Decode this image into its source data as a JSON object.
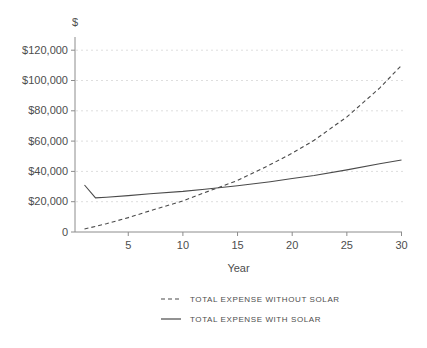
{
  "chart_data": {
    "type": "line",
    "title": "",
    "y_axis_title": "$",
    "x_axis_title": "Year",
    "x_range": [
      0,
      30
    ],
    "y_range": [
      0,
      130000
    ],
    "x_ticks": [
      5,
      10,
      15,
      20,
      25,
      30
    ],
    "y_ticks": [
      {
        "value": 0,
        "label": "0"
      },
      {
        "value": 20000,
        "label": "$20,000"
      },
      {
        "value": 40000,
        "label": "$40,000"
      },
      {
        "value": 60000,
        "label": "$60,000"
      },
      {
        "value": 80000,
        "label": "$80,000"
      },
      {
        "value": 100000,
        "label": "$100,000"
      },
      {
        "value": 120000,
        "label": "$120,000"
      }
    ],
    "grid": "horizontal-dotted",
    "legend_position": "bottom",
    "x": [
      1,
      2,
      3,
      5,
      7,
      10,
      12,
      15,
      18,
      20,
      22,
      25,
      28,
      30
    ],
    "series": [
      {
        "id": "without-solar",
        "name": "TOTAL EXPENSE WITHOUT SOLAR",
        "line_style": "dashed",
        "values": [
          2000,
          3700,
          5500,
          9500,
          14000,
          20500,
          26000,
          34000,
          44500,
          52000,
          60500,
          76000,
          95000,
          110000
        ]
      },
      {
        "id": "with-solar",
        "name": "TOTAL EXPENSE WITH SOLAR",
        "line_style": "solid",
        "values": [
          31000,
          22500,
          23000,
          24000,
          25200,
          26800,
          28200,
          30500,
          33200,
          35300,
          37300,
          41000,
          45000,
          47500
        ]
      }
    ],
    "crossover_year": 13,
    "colors": {
      "line": "#4a4a4a",
      "axis": "#8c8c8c",
      "grid": "#dedede",
      "text": "#4d4d4d",
      "background": "#ffffff"
    }
  }
}
